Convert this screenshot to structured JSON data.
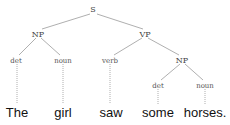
{
  "tree": {
    "root": "S",
    "nodes": {
      "s": "S",
      "np1": "NP",
      "vp": "VP",
      "det1": "det",
      "noun1": "noun",
      "verb": "verb",
      "np2": "NP",
      "det2": "det",
      "noun2": "noun"
    },
    "words": {
      "w1": "The",
      "w2": "girl",
      "w3": "saw",
      "w4": "some",
      "w5": "horses."
    },
    "edges": [
      [
        "S",
        "NP"
      ],
      [
        "S",
        "VP"
      ],
      [
        "NP",
        "det"
      ],
      [
        "NP",
        "noun"
      ],
      [
        "VP",
        "verb"
      ],
      [
        "VP",
        "NP"
      ],
      [
        "NP",
        "det"
      ],
      [
        "NP",
        "noun"
      ]
    ],
    "sentence": "The girl saw some horses."
  }
}
